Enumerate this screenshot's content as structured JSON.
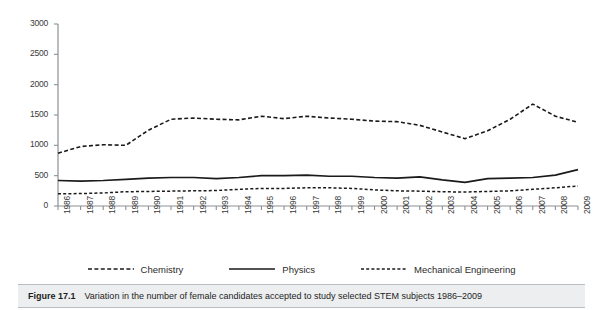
{
  "figure": {
    "caption_label": "Figure 17.1",
    "caption_text": "Variation in the number of female candidates accepted to study selected STEM subjects 1986–2009"
  },
  "legend": {
    "position": "bottom-center",
    "items": [
      {
        "label": "Chemistry",
        "style": "dashed",
        "color": "#1a1a1a"
      },
      {
        "label": "Physics",
        "style": "solid",
        "color": "#1a1a1a"
      },
      {
        "label": "Mechanical Engineering",
        "style": "dotted",
        "color": "#1a1a1a"
      }
    ]
  },
  "axes": {
    "y_ticks": [
      "0",
      "500",
      "1000",
      "1500",
      "2000",
      "2500",
      "3000"
    ],
    "x_ticks": [
      "1986",
      "1987",
      "1988",
      "1989",
      "1990",
      "1991",
      "1992",
      "1993",
      "1994",
      "1995",
      "1996",
      "1997",
      "1998",
      "1999",
      "2000",
      "2001",
      "2002",
      "2003",
      "2004",
      "2005",
      "2006",
      "2007",
      "2008",
      "2009"
    ]
  },
  "chart_data": {
    "type": "line",
    "title": "Variation in the number of female candidates accepted to study selected STEM subjects 1986–2009",
    "xlabel": "",
    "ylabel": "",
    "ylim": [
      0,
      3000
    ],
    "ytick_step": 500,
    "grid": false,
    "legend_position": "bottom-center",
    "x": [
      "1986",
      "1987",
      "1988",
      "1989",
      "1990",
      "1991",
      "1992",
      "1993",
      "1994",
      "1995",
      "1996",
      "1997",
      "1998",
      "1999",
      "2000",
      "2001",
      "2002",
      "2003",
      "2004",
      "2005",
      "2006",
      "2007",
      "2008",
      "2009"
    ],
    "series": [
      {
        "name": "Chemistry",
        "style": "dashed",
        "color": "#1a1a1a",
        "values": [
          870,
          980,
          1010,
          1000,
          1250,
          1430,
          1450,
          1430,
          1420,
          1480,
          1440,
          1480,
          1450,
          1430,
          1400,
          1390,
          1330,
          1220,
          1110,
          1240,
          1430,
          1680,
          1480,
          1380
        ]
      },
      {
        "name": "Physics",
        "style": "solid",
        "color": "#1a1a1a",
        "values": [
          420,
          410,
          420,
          440,
          460,
          470,
          470,
          450,
          470,
          500,
          500,
          510,
          490,
          490,
          470,
          460,
          480,
          430,
          390,
          450,
          460,
          470,
          510,
          600
        ]
      },
      {
        "name": "Mechanical Engineering",
        "style": "dotted",
        "color": "#1a1a1a",
        "values": [
          200,
          205,
          215,
          235,
          240,
          245,
          250,
          255,
          275,
          290,
          290,
          300,
          300,
          290,
          265,
          250,
          245,
          235,
          230,
          240,
          250,
          275,
          300,
          330
        ]
      }
    ]
  }
}
